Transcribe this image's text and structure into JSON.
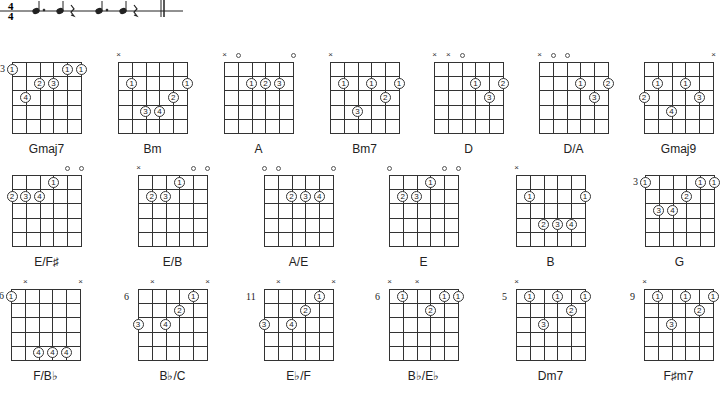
{
  "notation": {
    "time_signature": {
      "top": "4",
      "bottom": "4"
    },
    "rhythm": [
      "dotted-quarter",
      "quarter",
      "quarter-rest",
      "dotted-quarter",
      "quarter",
      "quarter-rest"
    ],
    "end_barline": "double"
  },
  "chords": [
    {
      "name": "Gmaj7",
      "x": 12,
      "y": 62,
      "fret": "3",
      "markers": [
        "",
        "",
        "",
        "",
        "",
        ""
      ],
      "fingers": [
        {
          "s": 0,
          "f": 1,
          "n": "1"
        },
        {
          "s": 4,
          "f": 1,
          "n": "1"
        },
        {
          "s": 5,
          "f": 1,
          "n": "1"
        },
        {
          "s": 2,
          "f": 2,
          "n": "2"
        },
        {
          "s": 3,
          "f": 2,
          "n": "3"
        },
        {
          "s": 1,
          "f": 3,
          "n": "4"
        }
      ]
    },
    {
      "name": "Bm",
      "x": 118,
      "y": 62,
      "fret": "",
      "markers": [
        "x",
        "",
        "",
        "",
        "",
        ""
      ],
      "fingers": [
        {
          "s": 1,
          "f": 2,
          "n": "1"
        },
        {
          "s": 5,
          "f": 2,
          "n": "1"
        },
        {
          "s": 4,
          "f": 3,
          "n": "2"
        },
        {
          "s": 2,
          "f": 4,
          "n": "3"
        },
        {
          "s": 3,
          "f": 4,
          "n": "4"
        }
      ]
    },
    {
      "name": "A",
      "x": 224,
      "y": 62,
      "fret": "",
      "markers": [
        "x",
        "o",
        "",
        "",
        "",
        "o"
      ],
      "fingers": [
        {
          "s": 2,
          "f": 2,
          "n": "1"
        },
        {
          "s": 3,
          "f": 2,
          "n": "2"
        },
        {
          "s": 4,
          "f": 2,
          "n": "3"
        }
      ]
    },
    {
      "name": "Bm7",
      "x": 330,
      "y": 62,
      "fret": "",
      "markers": [
        "x",
        "",
        "",
        "",
        "",
        ""
      ],
      "fingers": [
        {
          "s": 1,
          "f": 2,
          "n": "1"
        },
        {
          "s": 3,
          "f": 2,
          "n": "1"
        },
        {
          "s": 5,
          "f": 2,
          "n": "1"
        },
        {
          "s": 4,
          "f": 3,
          "n": "2"
        },
        {
          "s": 2,
          "f": 4,
          "n": "3"
        }
      ]
    },
    {
      "name": "D",
      "x": 434,
      "y": 62,
      "fret": "",
      "markers": [
        "x",
        "x",
        "o",
        "",
        "",
        ""
      ],
      "fingers": [
        {
          "s": 3,
          "f": 2,
          "n": "1"
        },
        {
          "s": 5,
          "f": 2,
          "n": "2"
        },
        {
          "s": 4,
          "f": 3,
          "n": "3"
        }
      ]
    },
    {
      "name": "D/A",
      "x": 539,
      "y": 62,
      "fret": "",
      "markers": [
        "x",
        "o",
        "o",
        "",
        "",
        ""
      ],
      "fingers": [
        {
          "s": 3,
          "f": 2,
          "n": "1"
        },
        {
          "s": 5,
          "f": 2,
          "n": "2"
        },
        {
          "s": 4,
          "f": 3,
          "n": "3"
        }
      ]
    },
    {
      "name": "Gmaj9",
      "x": 644,
      "y": 62,
      "fret": "",
      "markers": [
        "",
        "",
        "",
        "",
        "",
        "x"
      ],
      "fingers": [
        {
          "s": 1,
          "f": 2,
          "n": "1"
        },
        {
          "s": 3,
          "f": 2,
          "n": "1"
        },
        {
          "s": 0,
          "f": 3,
          "n": "2"
        },
        {
          "s": 4,
          "f": 3,
          "n": "3"
        },
        {
          "s": 2,
          "f": 4,
          "n": "4"
        }
      ]
    },
    {
      "name": "E/F♯",
      "x": 12,
      "y": 175,
      "fret": "",
      "markers": [
        "",
        "",
        "",
        "",
        "o",
        "o"
      ],
      "fingers": [
        {
          "s": 3,
          "f": 1,
          "n": "1"
        },
        {
          "s": 0,
          "f": 2,
          "n": "2"
        },
        {
          "s": 1,
          "f": 2,
          "n": "3"
        },
        {
          "s": 2,
          "f": 2,
          "n": "4"
        }
      ]
    },
    {
      "name": "E/B",
      "x": 138,
      "y": 175,
      "fret": "",
      "markers": [
        "x",
        "",
        "",
        "",
        "o",
        "o"
      ],
      "fingers": [
        {
          "s": 3,
          "f": 1,
          "n": "1"
        },
        {
          "s": 1,
          "f": 2,
          "n": "2"
        },
        {
          "s": 2,
          "f": 2,
          "n": "3"
        }
      ]
    },
    {
      "name": "A/E",
      "x": 264,
      "y": 175,
      "fret": "",
      "markers": [
        "o",
        "o",
        "",
        "",
        "",
        "o"
      ],
      "fingers": [
        {
          "s": 2,
          "f": 2,
          "n": "2"
        },
        {
          "s": 3,
          "f": 2,
          "n": "3"
        },
        {
          "s": 4,
          "f": 2,
          "n": "4"
        }
      ]
    },
    {
      "name": "E",
      "x": 389,
      "y": 175,
      "fret": "",
      "markers": [
        "o",
        "",
        "",
        "",
        "o",
        "o"
      ],
      "fingers": [
        {
          "s": 3,
          "f": 1,
          "n": "1"
        },
        {
          "s": 1,
          "f": 2,
          "n": "2"
        },
        {
          "s": 2,
          "f": 2,
          "n": "3"
        }
      ]
    },
    {
      "name": "B",
      "x": 516,
      "y": 175,
      "fret": "",
      "markers": [
        "x",
        "",
        "",
        "",
        "",
        ""
      ],
      "fingers": [
        {
          "s": 1,
          "f": 2,
          "n": "1"
        },
        {
          "s": 5,
          "f": 2,
          "n": "1"
        },
        {
          "s": 2,
          "f": 4,
          "n": "2"
        },
        {
          "s": 3,
          "f": 4,
          "n": "3"
        },
        {
          "s": 4,
          "f": 4,
          "n": "4"
        }
      ]
    },
    {
      "name": "G",
      "x": 645,
      "y": 175,
      "fret": "3",
      "markers": [
        "",
        "",
        "",
        "",
        "",
        ""
      ],
      "fingers": [
        {
          "s": 0,
          "f": 1,
          "n": "1"
        },
        {
          "s": 4,
          "f": 1,
          "n": "1"
        },
        {
          "s": 5,
          "f": 1,
          "n": "1"
        },
        {
          "s": 3,
          "f": 2,
          "n": "2"
        },
        {
          "s": 1,
          "f": 3,
          "n": "3"
        },
        {
          "s": 2,
          "f": 3,
          "n": "4"
        }
      ]
    },
    {
      "name": "F/B♭",
      "x": 11,
      "y": 289,
      "fret": "6",
      "markers": [
        "",
        "x",
        "",
        "",
        "",
        "x"
      ],
      "fingers": [
        {
          "s": 0,
          "f": 1,
          "n": "1"
        },
        {
          "s": 2,
          "f": 5,
          "n": "4"
        },
        {
          "s": 3,
          "f": 5,
          "n": "4"
        },
        {
          "s": 4,
          "f": 5,
          "n": "4"
        }
      ]
    },
    {
      "name": "B♭/C",
      "x": 138,
      "y": 289,
      "fret": "6",
      "markers": [
        "",
        "x",
        "",
        "",
        "",
        "x"
      ],
      "fingers": [
        {
          "s": 4,
          "f": 1,
          "n": "1"
        },
        {
          "s": 3,
          "f": 2,
          "n": "2"
        },
        {
          "s": 0,
          "f": 3,
          "n": "3"
        },
        {
          "s": 2,
          "f": 3,
          "n": "4"
        }
      ]
    },
    {
      "name": "E♭/F",
      "x": 264,
      "y": 289,
      "fret": "11",
      "markers": [
        "",
        "x",
        "",
        "",
        "",
        "x"
      ],
      "fingers": [
        {
          "s": 4,
          "f": 1,
          "n": "1"
        },
        {
          "s": 3,
          "f": 2,
          "n": "2"
        },
        {
          "s": 0,
          "f": 3,
          "n": "3"
        },
        {
          "s": 2,
          "f": 3,
          "n": "4"
        }
      ]
    },
    {
      "name": "B♭/E♭",
      "x": 389,
      "y": 289,
      "fret": "6",
      "markers": [
        "x",
        "",
        "x",
        "",
        "",
        ""
      ],
      "fingers": [
        {
          "s": 1,
          "f": 1,
          "n": "1"
        },
        {
          "s": 4,
          "f": 1,
          "n": "1"
        },
        {
          "s": 5,
          "f": 1,
          "n": "1"
        },
        {
          "s": 3,
          "f": 2,
          "n": "2"
        }
      ]
    },
    {
      "name": "Dm7",
      "x": 516,
      "y": 289,
      "fret": "5",
      "markers": [
        "x",
        "",
        "",
        "",
        "",
        ""
      ],
      "fingers": [
        {
          "s": 1,
          "f": 1,
          "n": "1"
        },
        {
          "s": 3,
          "f": 1,
          "n": "1"
        },
        {
          "s": 5,
          "f": 1,
          "n": "1"
        },
        {
          "s": 4,
          "f": 2,
          "n": "2"
        },
        {
          "s": 2,
          "f": 3,
          "n": "3"
        }
      ]
    },
    {
      "name": "F♯m7",
      "x": 644,
      "y": 289,
      "fret": "9",
      "markers": [
        "x",
        "",
        "",
        "",
        "",
        ""
      ],
      "fingers": [
        {
          "s": 1,
          "f": 1,
          "n": "1"
        },
        {
          "s": 3,
          "f": 1,
          "n": "1"
        },
        {
          "s": 5,
          "f": 1,
          "n": "1"
        },
        {
          "s": 4,
          "f": 2,
          "n": "2"
        },
        {
          "s": 2,
          "f": 3,
          "n": "3"
        }
      ]
    }
  ]
}
